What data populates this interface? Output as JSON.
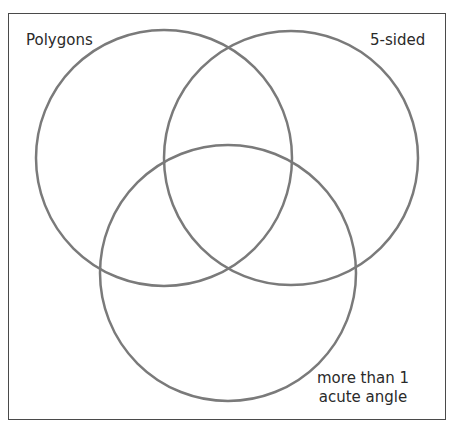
{
  "diagram": {
    "type": "venn",
    "sets": [
      {
        "id": "polygons",
        "label": "Polygons"
      },
      {
        "id": "five_sided",
        "label": "5-sided"
      },
      {
        "id": "acute",
        "label_line1": "more than 1",
        "label_line2": "acute angle"
      }
    ],
    "colors": {
      "circle_stroke": "#7a7a7a",
      "frame_stroke": "#4a4a4a",
      "text": "#2a2a2a",
      "background": "#ffffff"
    }
  }
}
